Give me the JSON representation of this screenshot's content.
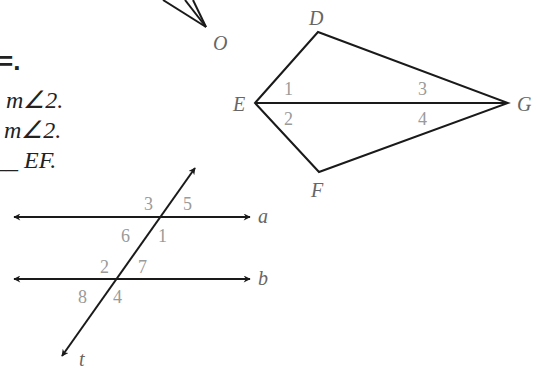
{
  "text_fragments": {
    "line0": "=.",
    "line1": "m∠2.",
    "line2": "m∠2.",
    "line3_prefix": "__",
    "line3_rest": "EF."
  },
  "figure_arrow": {
    "vertex_label": "O"
  },
  "kite": {
    "vertices": {
      "D": "D",
      "E": "E",
      "F": "F",
      "G": "G"
    },
    "angle_labels": [
      "1",
      "2",
      "3",
      "4"
    ]
  },
  "parallel_lines": {
    "line_a_label": "a",
    "line_b_label": "b",
    "transversal_label": "t",
    "angle_labels": {
      "a_top_left": "3",
      "a_top_right": "5",
      "a_bottom_left": "6",
      "a_bottom_right": "1",
      "b_top_left": "2",
      "b_top_right": "7",
      "b_bottom_left": "8",
      "b_bottom_right": "4"
    }
  },
  "colors": {
    "stroke": "#1a1a1a",
    "vertex_label": "#666666",
    "angle_label": "#9a9a9a"
  }
}
